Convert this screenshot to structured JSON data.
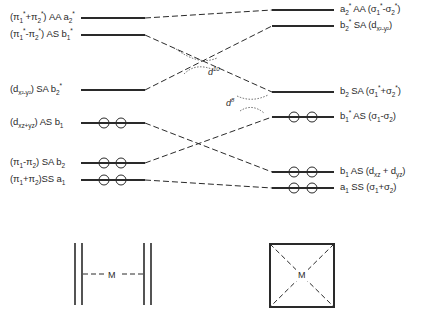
{
  "figure": {
    "type": "orbital correlation diagram",
    "stroke_color": "#2a2a2a",
    "background": "#ffffff"
  },
  "left_levels": [
    {
      "y": 18,
      "label": "(π1*+π2*) AA a2*",
      "electron_pairs": 0
    },
    {
      "y": 35,
      "label": "(π1*-π2*) AS b1*",
      "electron_pairs": 0
    },
    {
      "y": 90,
      "label": "(dx2-y2) SA b2*",
      "electron_pairs": 0
    },
    {
      "y": 123,
      "label": "(dxz+yz) AS b1",
      "electron_pairs": 2
    },
    {
      "y": 163,
      "label": "(π1-π2) SA b2",
      "electron_pairs": 2
    },
    {
      "y": 180,
      "label": "(π1+π2) SS a1",
      "electron_pairs": 2
    }
  ],
  "right_levels": [
    {
      "y": 10,
      "label": "a2* AA (σ1*-σ2*)",
      "electron_pairs": 0
    },
    {
      "y": 26,
      "label": "b2* SA (dx2-y2)",
      "electron_pairs": 0
    },
    {
      "y": 92,
      "label": "b2 SA (σ1*+σ2*)",
      "electron_pairs": 0
    },
    {
      "y": 117,
      "label": "b1* AS (σ1-σ2)",
      "electron_pairs": 2
    },
    {
      "y": 172,
      "label": "b1 AS (dxz+dyz)",
      "electron_pairs": 2
    },
    {
      "y": 188,
      "label": "a1 SS (σ1+σ2)",
      "electron_pairs": 2
    }
  ],
  "correlations": [
    {
      "from": 0,
      "to": 0
    },
    {
      "from": 1,
      "to": 2
    },
    {
      "from": 2,
      "to": 1
    },
    {
      "from": 3,
      "to": 4
    },
    {
      "from": 4,
      "to": 3
    },
    {
      "from": 5,
      "to": 5
    }
  ],
  "annotations": {
    "d10": "d",
    "d10_sup": "10",
    "d8": "d",
    "d8_sup": "8"
  },
  "insets": {
    "left": {
      "center_label": "M",
      "description": "two parallel double bonds with metal between"
    },
    "right": {
      "center_label": "M",
      "description": "square with dashed diagonals, metal at center"
    }
  },
  "labels_html": {
    "L0": [
      "(π",
      "1",
      "*",
      "+π",
      "2",
      "*",
      ") AA a",
      "2",
      "*"
    ],
    "L1": [
      "(π",
      "1",
      "*",
      "-π",
      "2",
      "*",
      ") AS b",
      "1",
      "*"
    ],
    "L2": [
      "(d",
      "x²-y²",
      ") SA b",
      "2",
      "*"
    ],
    "L3": [
      "(d",
      "xz+yz",
      ") AS b",
      "1"
    ],
    "L4": [
      "(π",
      "1",
      "-π",
      "2",
      ") SA b",
      "2"
    ],
    "L5": [
      "(π",
      "1",
      "+π",
      "2",
      ")SS a",
      "1"
    ],
    "R0": [
      "a",
      "2",
      "*",
      " AA (σ",
      "1",
      "*",
      "-σ",
      "2",
      "*",
      ")"
    ],
    "R1": [
      "b",
      "2",
      "*",
      " SA (d",
      "x²-y²",
      ")"
    ],
    "R2": [
      "b",
      "2",
      " SA (σ",
      "1",
      "*",
      "+σ",
      "2",
      "*",
      ")"
    ],
    "R3": [
      "b",
      "1",
      "*",
      " AS (σ",
      "1",
      "-σ",
      "2",
      ")"
    ],
    "R4": [
      "b",
      "1",
      " AS (d",
      "xz",
      " + d",
      "yz",
      ")"
    ],
    "R5": [
      "a",
      "1",
      " SS (σ",
      "1",
      "+σ",
      "2",
      ")"
    ]
  }
}
